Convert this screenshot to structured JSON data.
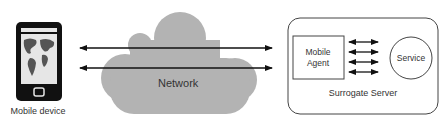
{
  "diagram": {
    "mobile_device": {
      "label": "Mobile device"
    },
    "network": {
      "label": "Network",
      "color": "#b3b3b3"
    },
    "surrogate_server": {
      "label": "Surrogate Server",
      "mobile_agent": {
        "line1": "Mobile",
        "line2": "Agent"
      },
      "service": {
        "label": "Service"
      }
    },
    "connections": [
      {
        "from": "mobile-device",
        "to": "surrogate-server",
        "type": "bidirectional"
      },
      {
        "from": "mobile-device",
        "to": "surrogate-server",
        "type": "bidirectional"
      }
    ],
    "internal_connections": 4
  }
}
